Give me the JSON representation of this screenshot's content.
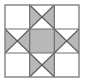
{
  "figure": {
    "name": "Ohio Star quilt block",
    "type": "quilt-block-diagram",
    "canvas": {
      "width": 85,
      "height": 83
    },
    "frame": {
      "x": 5,
      "y": 5,
      "width": 74,
      "height": 72,
      "stroke_color": "#808080",
      "stroke_width": 1.4
    },
    "grid": {
      "rows": 3,
      "cols": 3,
      "cell_width": 24.667,
      "cell_height": 24,
      "line_color": "#6e6e6e",
      "line_width": 1.2
    },
    "colors": {
      "background": "#ffffff",
      "light_patch": "#ffffff",
      "shaded_patch": "#b8b8b8",
      "center_patch": "#b8b8b8",
      "outline": "#5a5a5a",
      "frame": "#808080"
    },
    "cells": [
      {
        "row": 0,
        "col": 0,
        "name": "corner-top-left",
        "kind": "plain",
        "fill": "light"
      },
      {
        "row": 0,
        "col": 1,
        "name": "star-point-top",
        "kind": "hourglass",
        "shaded": "left-right"
      },
      {
        "row": 0,
        "col": 2,
        "name": "corner-top-right",
        "kind": "plain",
        "fill": "light"
      },
      {
        "row": 1,
        "col": 0,
        "name": "star-point-left",
        "kind": "hourglass",
        "shaded": "left-right"
      },
      {
        "row": 1,
        "col": 1,
        "name": "center-square",
        "kind": "plain",
        "fill": "shaded"
      },
      {
        "row": 1,
        "col": 2,
        "name": "star-point-right",
        "kind": "hourglass",
        "shaded": "left-right"
      },
      {
        "row": 2,
        "col": 0,
        "name": "corner-bottom-left",
        "kind": "plain",
        "fill": "light"
      },
      {
        "row": 2,
        "col": 1,
        "name": "star-point-bottom",
        "kind": "hourglass",
        "shaded": "left-right"
      },
      {
        "row": 2,
        "col": 2,
        "name": "corner-bottom-right",
        "kind": "plain",
        "fill": "light"
      }
    ]
  }
}
